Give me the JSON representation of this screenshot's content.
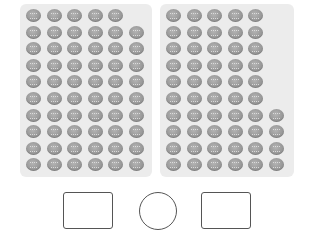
{
  "panels": [
    {
      "id": "left",
      "total": 59,
      "rows": [
        5,
        6,
        6,
        6,
        6,
        6,
        6,
        6,
        6,
        6
      ]
    },
    {
      "id": "right",
      "total": 54,
      "rows": [
        5,
        5,
        5,
        5,
        5,
        5,
        6,
        6,
        6,
        6
      ]
    }
  ],
  "item_icon": "cookie-icon",
  "layout": {
    "col_pitch": 20.5,
    "row_pitch": 16.6
  },
  "answer_shapes": [
    {
      "name": "answer-box-left",
      "shape": "rectangle",
      "value": ""
    },
    {
      "name": "comparison-circle",
      "shape": "circle",
      "value": ""
    },
    {
      "name": "answer-box-right",
      "shape": "rectangle",
      "value": ""
    }
  ],
  "colors": {
    "panel_bg": "#ececec",
    "cookie": "#9a9a9a",
    "outline": "#555555"
  }
}
